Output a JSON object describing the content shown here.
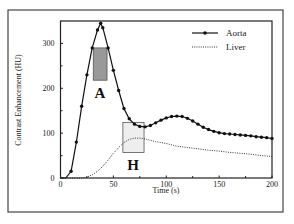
{
  "chart_data": {
    "type": "line",
    "title": "",
    "xlabel": "Time (s)",
    "ylabel": "Contrast Enhancement (HU)",
    "xlim": [
      0,
      200
    ],
    "ylim": [
      0,
      350
    ],
    "x_ticks": [
      0,
      50,
      100,
      150,
      200
    ],
    "x_minor_ticks": [
      25,
      75,
      125,
      175
    ],
    "y_ticks": [
      0,
      100,
      200,
      300
    ],
    "y_minor_ticks": [
      50,
      150,
      250
    ],
    "grid": false,
    "legend_position": "upper right",
    "series": [
      {
        "name": "Aorta",
        "style": "solid line with circle markers",
        "color": "#111111",
        "x": [
          0,
          5,
          10,
          15,
          20,
          25,
          30,
          35,
          38,
          40,
          45,
          50,
          55,
          60,
          65,
          70,
          75,
          80,
          85,
          90,
          95,
          100,
          105,
          110,
          115,
          120,
          125,
          130,
          135,
          140,
          145,
          150,
          155,
          160,
          165,
          170,
          175,
          180,
          185,
          190,
          195,
          200
        ],
        "values": [
          0,
          0,
          15,
          80,
          160,
          230,
          290,
          330,
          345,
          335,
          290,
          240,
          195,
          155,
          132,
          120,
          115,
          114,
          117,
          123,
          129,
          134,
          137,
          138,
          137,
          133,
          127,
          120,
          113,
          108,
          104,
          101,
          99,
          98,
          97,
          96,
          95,
          94,
          92,
          91,
          90,
          88
        ]
      },
      {
        "name": "Liver",
        "style": "dotted line",
        "color": "#333333",
        "x": [
          0,
          20,
          25,
          30,
          35,
          40,
          45,
          50,
          55,
          60,
          65,
          70,
          75,
          80,
          85,
          90,
          100,
          110,
          120,
          130,
          140,
          150,
          160,
          170,
          180,
          190,
          200
        ],
        "values": [
          0,
          0,
          2,
          7,
          15,
          26,
          40,
          55,
          68,
          79,
          86,
          89,
          89,
          87,
          84,
          81,
          77,
          71,
          68,
          65,
          62,
          60,
          57,
          55,
          53,
          50,
          48
        ]
      }
    ],
    "annotations": [
      {
        "label": "A",
        "box_x": [
          31,
          44
        ],
        "box_y": [
          218,
          290
        ],
        "fill": "#999999",
        "description": "shaded box at aortic peak"
      },
      {
        "label": "H",
        "box_x": [
          59,
          79
        ],
        "box_y": [
          57,
          124
        ],
        "fill": "#eeeeee",
        "description": "light box at hepatic phase"
      }
    ]
  },
  "labels": {
    "xlabel": "Time (s)",
    "ylabel": "Contrast Enhancement (HU)",
    "x_ticks": [
      "0",
      "50",
      "100",
      "150",
      "200"
    ],
    "y_ticks": [
      "0",
      "100",
      "200",
      "300"
    ],
    "legend": [
      "Aorta",
      "Liver"
    ],
    "region_a": "A",
    "region_h": "H"
  }
}
